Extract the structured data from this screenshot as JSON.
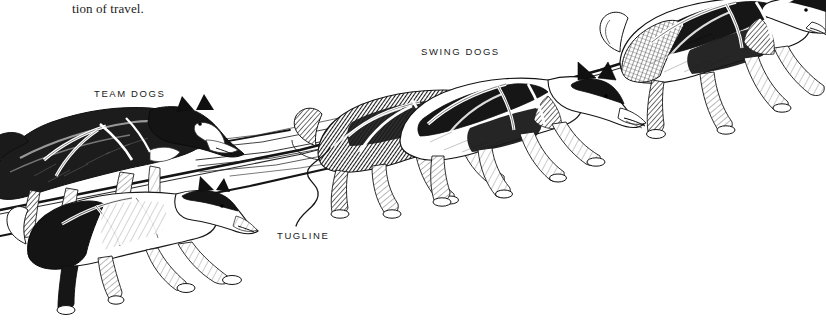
{
  "page": {
    "width": 826,
    "height": 325,
    "background_color": "#ffffff",
    "ink_color": "#1a1a1a",
    "body_text": "tion of travel."
  },
  "illustration": {
    "title": "sled-dog-team-diagram",
    "medium": "pen-and-ink line drawing",
    "subject": "A harnessed dog sled team of five sled dogs running toward the upper right, connected by a gangline and tuglines.",
    "labels": [
      {
        "id": "team-dogs",
        "text": "TEAM DOGS",
        "x": 94,
        "y": 88
      },
      {
        "id": "swing-dogs",
        "text": "SWING DOGS",
        "x": 421,
        "y": 46
      },
      {
        "id": "tugline",
        "text": "TUGLINE",
        "x": 277,
        "y": 230
      }
    ],
    "leader_line": {
      "id": "tugline-leader",
      "from": {
        "x": 298,
        "y": 226
      },
      "to": {
        "x": 330,
        "y": 148
      },
      "shape": "wavy S-curve"
    },
    "dogs": [
      {
        "id": "team-dog-upper-left",
        "position": "far left, upper",
        "coat": "dark with white blaze and white chest",
        "cut_off_at_edge": true
      },
      {
        "id": "team-dog-lower-left",
        "position": "far left, lower",
        "coat": "white body with black head markings and black hindquarters",
        "cut_off_at_edge": true
      },
      {
        "id": "swing-dog-rear",
        "position": "center left",
        "coat": "dark brindled back, light legs",
        "cut_off_at_edge": false
      },
      {
        "id": "swing-dog-front",
        "position": "center right",
        "coat": "black and white with white muzzle",
        "cut_off_at_edge": false
      },
      {
        "id": "lead-dog",
        "position": "far right",
        "coat": "black and white, heavy ruff",
        "cut_off_at_edge": false
      }
    ],
    "lines": {
      "gangline": "single heavy line running from lower-left edge up to the lead dog's harness at upper right",
      "tuglines": "multiple thin lines fanning from the team dogs forward to the swing dogs"
    }
  }
}
